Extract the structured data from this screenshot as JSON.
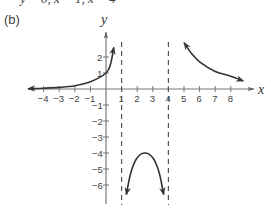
{
  "header": {
    "cut_line": "y = 0, x = 1, x = 4",
    "panel_label": "(b)"
  },
  "chart_data": {
    "type": "line",
    "title": "",
    "panel": "(b)",
    "xlabel": "x",
    "ylabel": "y",
    "xlim": [
      -4.5,
      9
    ],
    "ylim": [
      -7,
      3.5
    ],
    "grid": false,
    "legend": null,
    "x_ticks": [
      -4,
      -3,
      -2,
      -1,
      1,
      2,
      3,
      4,
      5,
      6,
      7,
      8
    ],
    "x_tick_labels": [
      "−4",
      "−3",
      "−2",
      "−1",
      "1",
      "2",
      "3",
      "4",
      "5",
      "6",
      "7",
      "8"
    ],
    "y_ticks": [
      2,
      1,
      -1,
      -2,
      -3,
      -4,
      -5,
      -6
    ],
    "y_tick_labels": [
      "2",
      "1",
      "−1",
      "−2",
      "−3",
      "−4",
      "−5",
      "−6"
    ],
    "vertical_asymptotes": [
      1,
      4
    ],
    "horizontal_asymptote": 0,
    "series": [
      {
        "name": "left branch (x < 1)",
        "points": [
          [
            -5,
            0.02
          ],
          [
            -4,
            0.05
          ],
          [
            -3,
            0.1
          ],
          [
            -2,
            0.2
          ],
          [
            -1,
            0.45
          ],
          [
            0,
            1
          ],
          [
            0.3,
            1.6
          ],
          [
            0.5,
            2.6
          ]
        ],
        "arrows": "both ends"
      },
      {
        "name": "middle branch (1 < x < 4)",
        "points": [
          [
            1.3,
            -6.6
          ],
          [
            1.6,
            -5.2
          ],
          [
            2,
            -4.3
          ],
          [
            2.5,
            -4
          ],
          [
            3,
            -4.3
          ],
          [
            3.4,
            -5.2
          ],
          [
            3.7,
            -6.6
          ]
        ],
        "vertex": [
          2.5,
          -4
        ],
        "arrows": "both ends"
      },
      {
        "name": "right branch (x > 4)",
        "points": [
          [
            5,
            2.9
          ],
          [
            5.5,
            2.2
          ],
          [
            6,
            1.7
          ],
          [
            7,
            1.1
          ],
          [
            8,
            0.8
          ],
          [
            8.8,
            0.5
          ]
        ],
        "arrows": "both ends"
      }
    ]
  }
}
